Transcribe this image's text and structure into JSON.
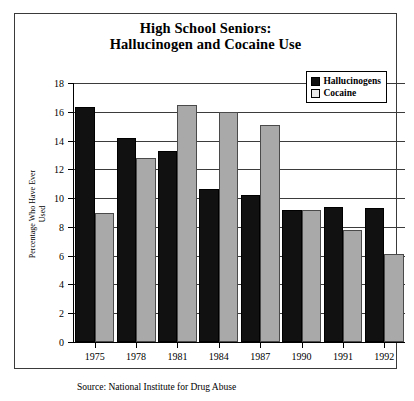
{
  "chart_data": {
    "type": "bar",
    "title": "High School Seniors: Hallucinogen and Cocaine Use",
    "title_line1": "High School Seniors:",
    "title_line2": "Hallucinogen and Cocaine Use",
    "categories": [
      "1975",
      "1978",
      "1981",
      "1984",
      "1987",
      "1990",
      "1991",
      "1992"
    ],
    "series": [
      {
        "name": "Hallucinogens",
        "color": "#111111",
        "values": [
          16.3,
          14.2,
          13.3,
          10.6,
          10.2,
          9.2,
          9.4,
          9.3
        ]
      },
      {
        "name": "Cocaine",
        "color": "#a9a9a9",
        "values": [
          9.0,
          12.8,
          16.5,
          16.0,
          15.1,
          9.2,
          7.8,
          6.1
        ]
      }
    ],
    "xlabel": "",
    "ylabel_line1": "Percentage Who Have Ever",
    "ylabel_line2": "Used",
    "ylim": [
      0,
      18
    ],
    "yticks": [
      "18",
      "16",
      "14",
      "12",
      "10",
      "8",
      "6",
      "4",
      "2",
      "0"
    ],
    "ytick_values": [
      18,
      16,
      14,
      12,
      10,
      8,
      6,
      4,
      2,
      0
    ],
    "grid": true,
    "legend_position": "top-right",
    "source_note": "Source: National Institute for Drug Abuse"
  }
}
